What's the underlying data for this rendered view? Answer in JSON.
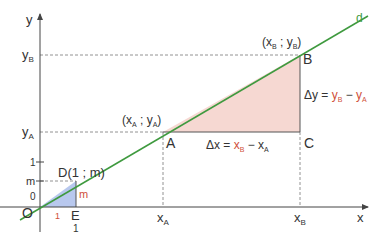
{
  "colors": {
    "axis": "#444444",
    "line_d": "#3f9a3f",
    "dashed": "#777777",
    "fill_big": "#f6d8d2",
    "fill_small": "#b8c8ee",
    "accent_red": "#d0503a",
    "text": "#333333"
  },
  "axes": {
    "x_label": "x",
    "y_label": "y",
    "origin_label": "O",
    "zero_label": "0"
  },
  "line": {
    "label": "d"
  },
  "points": {
    "A": {
      "label": "A",
      "coords": "(x",
      "sub1": "A",
      "sep": " ; y",
      "sub2": "A",
      "close": ")"
    },
    "B": {
      "label": "B",
      "coords": "(x",
      "sub1": "B",
      "sep": " ; y",
      "sub2": "B",
      "close": ")"
    },
    "C": {
      "label": "C"
    },
    "D": {
      "label": "D(1 ; m)"
    },
    "E": {
      "label": "E",
      "below": "1"
    }
  },
  "ticks": {
    "y_B": {
      "main": "y",
      "sub": "B"
    },
    "y_A": {
      "main": "y",
      "sub": "A"
    },
    "y_1": "1",
    "y_m": "m",
    "x_A": {
      "main": "x",
      "sub": "A"
    },
    "x_B": {
      "main": "x",
      "sub": "B"
    },
    "x_1": "1"
  },
  "annotations": {
    "small_m": "m",
    "dx": {
      "lhs": "Δx = ",
      "t1": "x",
      "s1": "B",
      "minus": " − ",
      "t2": "x",
      "s2": "A"
    },
    "dy": {
      "lhs": "Δy = ",
      "t1": "y",
      "s1": "B",
      "minus": " − ",
      "t2": "y",
      "s2": "A"
    }
  }
}
